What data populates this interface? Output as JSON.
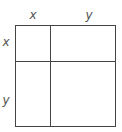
{
  "diagram": {
    "type": "area-model-square",
    "top_labels": [
      {
        "text": "x",
        "segment": "left-column"
      },
      {
        "text": "y",
        "segment": "right-column"
      }
    ],
    "side_labels": [
      {
        "text": "x",
        "segment": "top-row"
      },
      {
        "text": "y",
        "segment": "bottom-row"
      }
    ],
    "cells": [
      {
        "row": "x",
        "col": "x",
        "content": ""
      },
      {
        "row": "x",
        "col": "y",
        "content": ""
      },
      {
        "row": "y",
        "col": "x",
        "content": ""
      },
      {
        "row": "y",
        "col": "y",
        "content": ""
      }
    ],
    "colors": {
      "line": "#444444",
      "label": "#555555",
      "background": "#ffffff"
    }
  }
}
